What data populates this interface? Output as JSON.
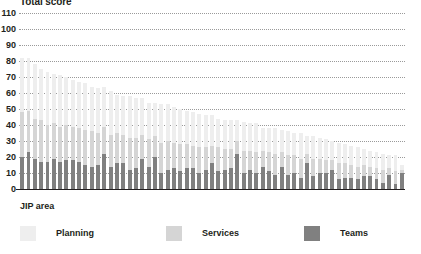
{
  "chart_data": {
    "type": "bar",
    "stacked": true,
    "title": "Total score",
    "xlabel": "JIP area",
    "ylabel": "",
    "ylim": [
      0,
      110
    ],
    "ytick_step": 10,
    "yticks": [
      110,
      100,
      90,
      80,
      70,
      60,
      50,
      40,
      30,
      20,
      10,
      0
    ],
    "grid": true,
    "grid_style": "dotted",
    "legend_position": "bottom",
    "legend": [
      "Planning",
      "Services",
      "Teams"
    ],
    "colors": {
      "planning": "#eeeeee",
      "services": "#d5d5d5",
      "teams": "#808080",
      "gridline": "#9a9a9a",
      "axis": "#231f20",
      "text": "#231f20",
      "background": "#ffffff"
    },
    "categories": [
      "1",
      "2",
      "3",
      "4",
      "5",
      "6",
      "7",
      "8",
      "9",
      "10",
      "11",
      "12",
      "13",
      "14",
      "15",
      "16",
      "17",
      "18",
      "19",
      "20",
      "21",
      "22",
      "23",
      "24",
      "25",
      "26",
      "27",
      "28",
      "29",
      "30",
      "31",
      "32",
      "33",
      "34",
      "35",
      "36",
      "37",
      "38",
      "39",
      "40",
      "41",
      "42",
      "43",
      "44",
      "45",
      "46",
      "47",
      "48",
      "49",
      "50",
      "51",
      "52",
      "53",
      "54",
      "55",
      "56",
      "57",
      "58",
      "59",
      "60",
      "61"
    ],
    "series": [
      {
        "name": "Teams",
        "values": [
          20,
          23,
          19,
          17,
          17,
          19,
          17,
          18,
          18,
          17,
          15,
          14,
          15,
          22,
          14,
          16,
          16,
          12,
          13,
          19,
          14,
          20,
          10,
          12,
          13,
          11,
          13,
          13,
          10,
          12,
          16,
          11,
          12,
          13,
          22,
          10,
          12,
          10,
          14,
          11,
          9,
          14,
          9,
          10,
          7,
          16,
          8,
          10,
          10,
          12,
          6,
          7,
          7,
          6,
          8,
          8,
          6,
          4,
          9,
          3,
          10
        ]
      },
      {
        "name": "Services",
        "values": [
          28,
          26,
          25,
          26,
          23,
          22,
          22,
          22,
          21,
          21,
          22,
          22,
          20,
          17,
          20,
          19,
          18,
          20,
          19,
          15,
          17,
          13,
          19,
          18,
          16,
          17,
          15,
          14,
          16,
          14,
          11,
          15,
          13,
          12,
          8,
          14,
          12,
          13,
          10,
          12,
          13,
          9,
          12,
          11,
          12,
          6,
          11,
          9,
          8,
          6,
          10,
          9,
          8,
          8,
          7,
          6,
          7,
          8,
          4,
          8,
          2
        ]
      },
      {
        "name": "Planning",
        "values": [
          34,
          33,
          34,
          32,
          33,
          31,
          32,
          30,
          29,
          29,
          29,
          28,
          28,
          25,
          27,
          24,
          24,
          26,
          25,
          23,
          23,
          21,
          24,
          23,
          22,
          22,
          21,
          21,
          21,
          20,
          19,
          18,
          18,
          18,
          13,
          18,
          17,
          18,
          14,
          15,
          16,
          14,
          15,
          14,
          16,
          11,
          14,
          13,
          13,
          12,
          13,
          12,
          12,
          12,
          10,
          10,
          10,
          10,
          8,
          10,
          3
        ]
      }
    ]
  }
}
